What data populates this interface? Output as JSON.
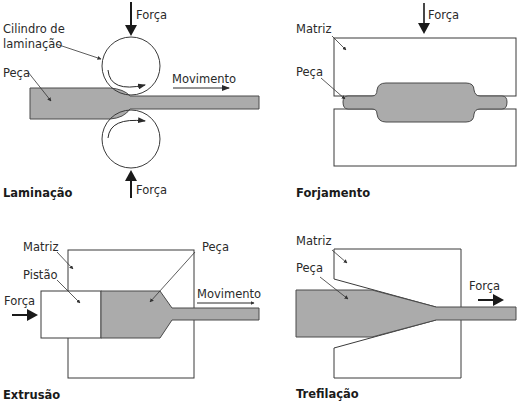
{
  "colors": {
    "background": "#ffffff",
    "piece_fill": "#ababab",
    "outline": "#3a3a3a",
    "text": "#2a2a2a"
  },
  "panels": {
    "laminacao": {
      "title": "Laminação",
      "labels": {
        "force_top": "Força",
        "force_bottom": "Força",
        "roll_line1": "Cilindro de",
        "roll_line2": "laminação",
        "piece": "Peça",
        "movement": "Movimento"
      },
      "icons": [
        "down-arrow-icon",
        "up-arrow-icon",
        "right-arrow-icon",
        "rotation-arrow-icon"
      ]
    },
    "forjamento": {
      "title": "Forjamento",
      "labels": {
        "force": "Força",
        "die": "Matriz",
        "piece": "Peça"
      },
      "icons": [
        "down-arrow-icon"
      ]
    },
    "extrusao": {
      "title": "Extrusão",
      "labels": {
        "die": "Matriz",
        "piston": "Pistão",
        "force": "Força",
        "piece": "Peça",
        "movement": "Movimento"
      },
      "icons": [
        "right-arrow-icon"
      ]
    },
    "trefilacao": {
      "title": "Trefilação",
      "labels": {
        "die": "Matriz",
        "piece": "Peça",
        "force": "Força"
      },
      "icons": [
        "right-arrow-icon"
      ]
    }
  }
}
